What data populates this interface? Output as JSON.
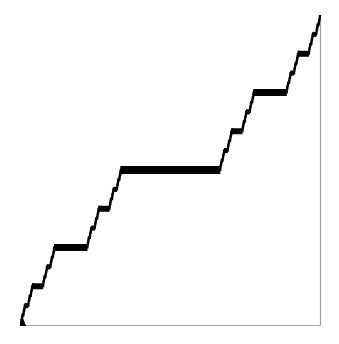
{
  "chart_data": {
    "type": "line",
    "title": "",
    "subtitle": "",
    "xlabel": "",
    "ylabel": "",
    "description": "Cantor function (devil's staircase): monotone non-decreasing step curve from (0,0) to (1,1) with flat plateaus over the removed middle-third intervals",
    "xlim": [
      0,
      1
    ],
    "ylim": [
      0,
      1
    ],
    "grid": false,
    "legend": null,
    "ticks": {
      "x": [],
      "y": []
    },
    "frame": {
      "left": false,
      "bottom": true,
      "right": true,
      "top": false
    },
    "recursion_depth": 4,
    "plateaus": [
      {
        "x_start": 0.3333,
        "x_end": 0.6667,
        "y": 0.5
      },
      {
        "x_start": 0.1111,
        "x_end": 0.2222,
        "y": 0.25
      },
      {
        "x_start": 0.7778,
        "x_end": 0.8889,
        "y": 0.75
      },
      {
        "x_start": 0.037,
        "x_end": 0.0741,
        "y": 0.125
      },
      {
        "x_start": 0.2593,
        "x_end": 0.2963,
        "y": 0.375
      },
      {
        "x_start": 0.7037,
        "x_end": 0.7407,
        "y": 0.625
      },
      {
        "x_start": 0.9259,
        "x_end": 0.963,
        "y": 0.875
      }
    ],
    "endpoints": [
      {
        "x": 0,
        "y": 0
      },
      {
        "x": 1,
        "y": 1
      }
    ]
  },
  "style": {
    "curve_color": "#000000",
    "frame_color": "#a0a0a0",
    "background": "#ffffff",
    "plot_area_px": {
      "left": 21,
      "top": 15,
      "right": 320,
      "bottom": 325
    },
    "plateau_thickness_px": [
      8,
      7,
      6,
      5,
      4
    ]
  }
}
